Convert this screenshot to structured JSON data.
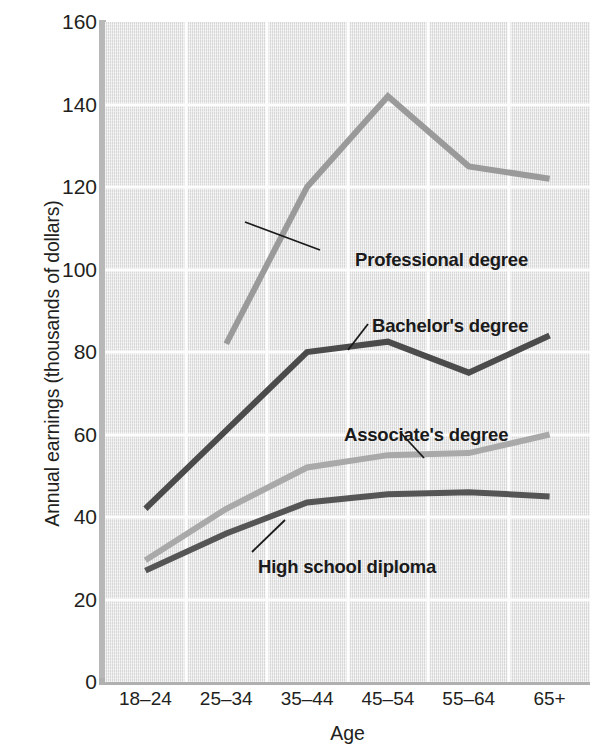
{
  "chart_data": {
    "type": "line",
    "title": "",
    "xlabel": "Age",
    "ylabel": "Annual earnings (thousands of dollars)",
    "categories": [
      "18–24",
      "25–34",
      "35–44",
      "45–54",
      "55–64",
      "65+"
    ],
    "ylim": [
      0,
      160
    ],
    "yticks": [
      0,
      20,
      40,
      60,
      80,
      100,
      120,
      140,
      160
    ],
    "ytick_labels": [
      "0",
      "20",
      "40",
      "60",
      "80",
      "100",
      "120",
      "140",
      "160"
    ],
    "grid": true,
    "legend_position": "inline-annotations",
    "series": [
      {
        "name": "Professional degree",
        "color": "#9a9a9a",
        "values": [
          null,
          82,
          120,
          142,
          125,
          122
        ],
        "label_x": 355,
        "label_y": 249,
        "leader": [
          320,
          250,
          245,
          222
        ]
      },
      {
        "name": "Bachelor's degree",
        "color": "#4b4b4b",
        "values": [
          42,
          61,
          80,
          82.5,
          75,
          84
        ],
        "label_x": 372,
        "label_y": 315,
        "leader": [
          368,
          324,
          348,
          350
        ]
      },
      {
        "name": "Associate's degree",
        "color": "#a9a9a9",
        "values": [
          29.5,
          42,
          52,
          55,
          55.5,
          60
        ],
        "label_x": 344,
        "label_y": 424,
        "leader": [
          400,
          432,
          424,
          458
        ]
      },
      {
        "name": "High school diploma",
        "color": "#555555",
        "values": [
          27,
          36,
          43.5,
          45.5,
          46,
          45
        ],
        "label_x": 258,
        "label_y": 556,
        "leader": [
          252,
          552,
          285,
          520
        ]
      }
    ]
  },
  "axis": {
    "y_title": "Annual earnings (thousands of dollars)",
    "x_title": "Age"
  }
}
